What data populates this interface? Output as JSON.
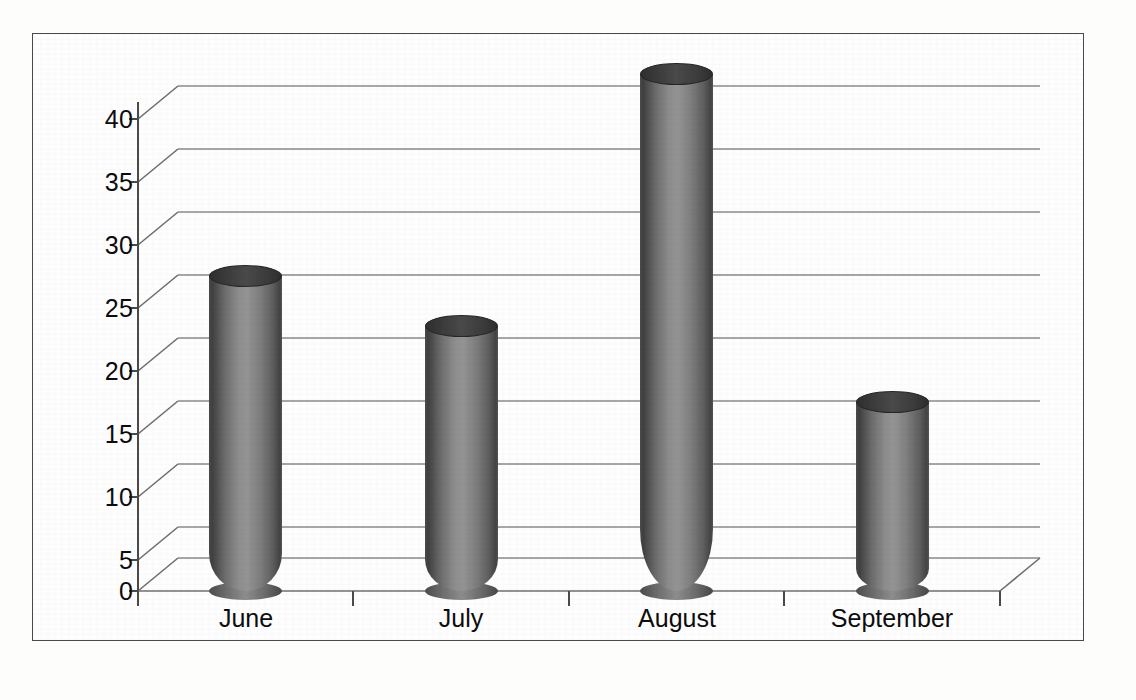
{
  "chart_data": {
    "type": "bar",
    "title": "",
    "subtitle": "",
    "xlabel": "",
    "ylabel": "",
    "categories": [
      "June",
      "July",
      "August",
      "September"
    ],
    "values": [
      25,
      21,
      41,
      15
    ],
    "series": [
      {
        "name": "Series 1",
        "values": [
          25,
          21,
          41,
          15
        ]
      }
    ],
    "ylim": [
      0,
      40
    ],
    "ytick_labels": [
      "0",
      "5",
      "10",
      "15",
      "20",
      "25",
      "30",
      "35",
      "40"
    ],
    "ytick_values": [
      0,
      5,
      10,
      15,
      20,
      25,
      30,
      35,
      40
    ],
    "grid": true,
    "grid_axis": "y",
    "legend": false,
    "legend_position": "none",
    "style": "3d-cylinder",
    "bar_color": "#808080",
    "grid_color": "#808080",
    "axis_color": "#4a4a4a",
    "background": "#ffffff",
    "annotations": []
  }
}
